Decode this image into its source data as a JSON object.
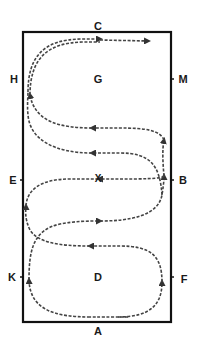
{
  "diagram": {
    "arena": {
      "x": 23,
      "y": 32,
      "width": 148,
      "height": 290,
      "stroke": "#111111"
    },
    "path_color": "#444444",
    "letters": [
      {
        "id": "C",
        "label": "C",
        "x": 98,
        "y": 26
      },
      {
        "id": "H",
        "label": "H",
        "x": 14,
        "y": 79
      },
      {
        "id": "G",
        "label": "G",
        "x": 98,
        "y": 79
      },
      {
        "id": "M",
        "label": "M",
        "x": 183,
        "y": 79
      },
      {
        "id": "E",
        "label": "E",
        "x": 13,
        "y": 180
      },
      {
        "id": "B",
        "label": "B",
        "x": 183,
        "y": 180
      },
      {
        "id": "K",
        "label": "K",
        "x": 12,
        "y": 277
      },
      {
        "id": "D",
        "label": "D",
        "x": 98,
        "y": 277
      },
      {
        "id": "F",
        "label": "F",
        "x": 184,
        "y": 279
      },
      {
        "id": "A",
        "label": "A",
        "x": 98,
        "y": 331
      }
    ],
    "center_marker": {
      "id": "X",
      "label": "X",
      "x": 98,
      "y": 179
    }
  }
}
